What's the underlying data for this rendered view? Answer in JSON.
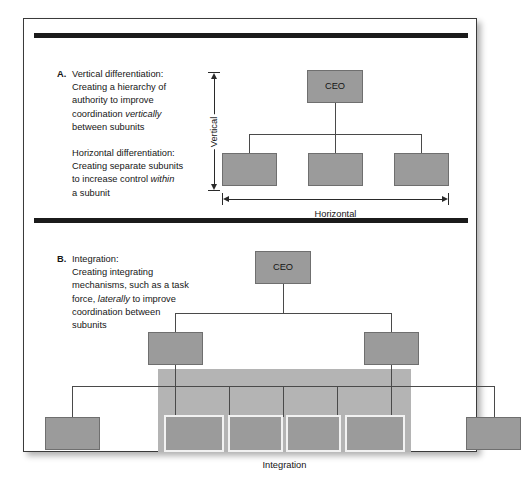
{
  "figure": {
    "sections": [
      {
        "marker": "A.",
        "title": "Vertical differentiation:",
        "paragraph1_pre": "Creating a hierarchy of\nauthority to improve\ncoordination ",
        "paragraph1_italic": "vertically",
        "paragraph1_post": "\nbetween subunits",
        "subtitle": "Horizontal differentiation:",
        "paragraph2_pre": "Creating separate subunits\nto increase control ",
        "paragraph2_italic": "within",
        "paragraph2_post": "\na subunit",
        "chart": {
          "root_label": "CEO",
          "vertical_axis_label": "Vertical",
          "horizontal_axis_label": "Horizontal",
          "subunit_count": 3
        }
      },
      {
        "marker": "B.",
        "title": "Integration:",
        "paragraph1_pre": "Creating integrating\nmechanisms, such as a task\nforce, ",
        "paragraph1_italic": "laterally",
        "paragraph1_post": " to improve\ncoordination between\nsubunits",
        "chart": {
          "root_label": "CEO",
          "integration_label": "Integration",
          "mid_level_count": 2,
          "bottom_level_count": 6,
          "integrated_subunit_count": 4
        }
      }
    ],
    "colors": {
      "box_fill": "#9b9b9b",
      "box_border": "#6f6f6f",
      "integration_panel": "#b4b4b4",
      "rule": "#1b1b1b",
      "frame_border": "#3a3a3a",
      "connector": "#4a4a4a",
      "inner_box_border": "#f2f2f2",
      "page_background": "#ffffff",
      "text": "#161616"
    }
  }
}
